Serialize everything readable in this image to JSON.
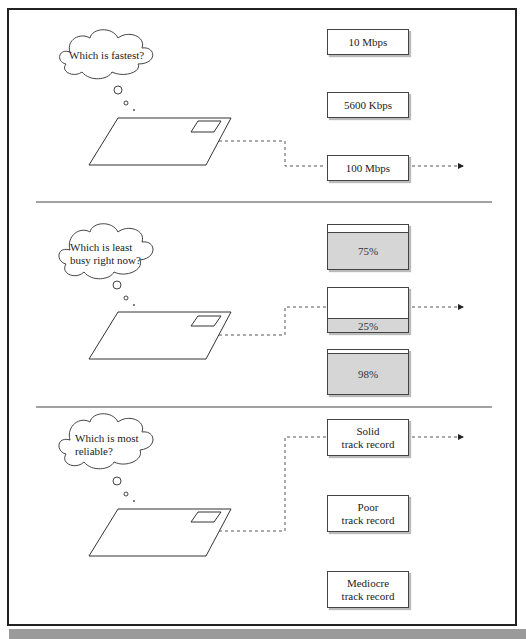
{
  "diagram": {
    "panels": [
      {
        "question": "Which is fastest?",
        "options": [
          {
            "label": "10 Mbps",
            "selected": false
          },
          {
            "label": "5600 Kbps",
            "selected": false
          },
          {
            "label": "100 Mbps",
            "selected": true
          }
        ]
      },
      {
        "question_line1": "Which is least",
        "question_line2": "busy right now?",
        "options": [
          {
            "label": "75%",
            "fill_percent": 75,
            "selected": false
          },
          {
            "label": "25%",
            "fill_percent": 25,
            "selected": true
          },
          {
            "label": "98%",
            "fill_percent": 98,
            "selected": false
          }
        ]
      },
      {
        "question_line1": "Which is most",
        "question_line2": "reliable?",
        "options": [
          {
            "line1": "Solid",
            "line2": "track record",
            "selected": true
          },
          {
            "line1": "Poor",
            "line2": "track record",
            "selected": false
          },
          {
            "line1": "Mediocre",
            "line2": "track record",
            "selected": false
          }
        ]
      }
    ],
    "colors": {
      "line": "#333333",
      "gauge_fill": "#d6d6d6",
      "footer": "#9a9a9a"
    }
  }
}
